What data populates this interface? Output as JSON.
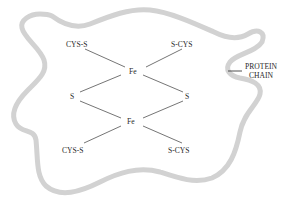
{
  "diagram": {
    "colors": {
      "protein_chain": "#d2d2d2",
      "bond": "#3a3a3a",
      "text": "#2a2a2a"
    },
    "labels": {
      "cys_top_left": "CYS-S",
      "cys_top_right": "S-CYS",
      "fe_top": "Fe",
      "s_left": "S",
      "s_right": "S",
      "fe_bottom": "Fe",
      "cys_bottom_left": "CYS-S",
      "cys_bottom_right": "S-CYS",
      "protein_line1": "PROTEIN",
      "protein_line2": "CHAIN"
    },
    "nodes": [
      {
        "id": "cys_top_left",
        "label": "CYS-S"
      },
      {
        "id": "cys_top_right",
        "label": "S-CYS"
      },
      {
        "id": "fe_top",
        "label": "Fe"
      },
      {
        "id": "s_left",
        "label": "S"
      },
      {
        "id": "s_right",
        "label": "S"
      },
      {
        "id": "fe_bottom",
        "label": "Fe"
      },
      {
        "id": "cys_bottom_left",
        "label": "CYS-S"
      },
      {
        "id": "cys_bottom_right",
        "label": "S-CYS"
      },
      {
        "id": "protein_chain",
        "label": "PROTEIN CHAIN"
      }
    ],
    "edges": [
      {
        "from": "cys_top_left",
        "to": "fe_top"
      },
      {
        "from": "cys_top_right",
        "to": "fe_top"
      },
      {
        "from": "fe_top",
        "to": "s_left"
      },
      {
        "from": "fe_top",
        "to": "s_right"
      },
      {
        "from": "s_left",
        "to": "fe_bottom"
      },
      {
        "from": "s_right",
        "to": "fe_bottom"
      },
      {
        "from": "fe_bottom",
        "to": "cys_bottom_left"
      },
      {
        "from": "fe_bottom",
        "to": "cys_bottom_right"
      }
    ]
  }
}
